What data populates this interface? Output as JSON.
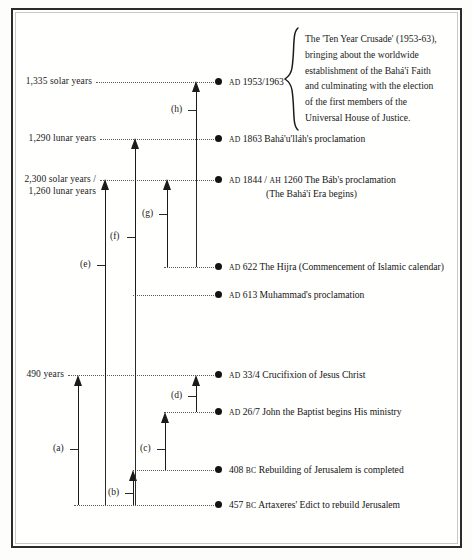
{
  "diagram": {
    "frame_color": "#2b2b2b",
    "ink_color": "#131313"
  },
  "span_labels": [
    {
      "id": "s1335",
      "text": "1,335 solar years"
    },
    {
      "id": "s1290",
      "text": "1,290 lunar years"
    },
    {
      "id": "s2300",
      "text": "2,300 solar years /\n1,260 lunar years"
    },
    {
      "id": "s490",
      "text": "490 years"
    }
  ],
  "events": [
    {
      "id": "ev-1953",
      "era": "AD",
      "label": "1953/1963",
      "sub": ""
    },
    {
      "id": "ev-1863",
      "era": "AD",
      "label": "1863 Bahá'u'lláh's proclamation",
      "sub": ""
    },
    {
      "id": "ev-1844",
      "era": "AD",
      "label": "1844 /",
      "era2": "AH",
      "label2": "1260  The Báb's proclamation",
      "sub": "(The Bahá'í Era begins)"
    },
    {
      "id": "ev-622",
      "era": "AD",
      "label": "622 The Hijra (Commencement of Islamic calendar)",
      "sub": ""
    },
    {
      "id": "ev-613",
      "era": "AD",
      "label": "613 Muhammad's proclamation",
      "sub": ""
    },
    {
      "id": "ev-33",
      "era": "AD",
      "label": "33/4 Crucifixion of Jesus Christ",
      "sub": ""
    },
    {
      "id": "ev-26",
      "era": "AD",
      "label": "26/7 John the Baptist begins His ministry",
      "sub": ""
    },
    {
      "id": "ev-408",
      "era": "BC",
      "label": "408",
      "label_after": "Rebuilding of Jerusalem is completed",
      "sub": ""
    },
    {
      "id": "ev-457",
      "era": "BC",
      "label": "457",
      "label_after": "Artaxeres' Edict to rebuild Jerusalem",
      "sub": ""
    }
  ],
  "keys": [
    {
      "id": "key-a",
      "text": "(a)"
    },
    {
      "id": "key-b",
      "text": "(b)"
    },
    {
      "id": "key-c",
      "text": "(c)"
    },
    {
      "id": "key-d",
      "text": "(d)"
    },
    {
      "id": "key-e",
      "text": "(e)"
    },
    {
      "id": "key-f",
      "text": "(f)"
    },
    {
      "id": "key-g",
      "text": "(g)"
    },
    {
      "id": "key-h",
      "text": "(h)"
    }
  ],
  "note": {
    "brace": "{",
    "text": "The 'Ten Year Crusade' (1953-63),\nbringing about the worldwide\nestablishment of the Bahá'í Faith\nand culminating with the election\nof the first members of the\nUniversal House of Justice."
  }
}
